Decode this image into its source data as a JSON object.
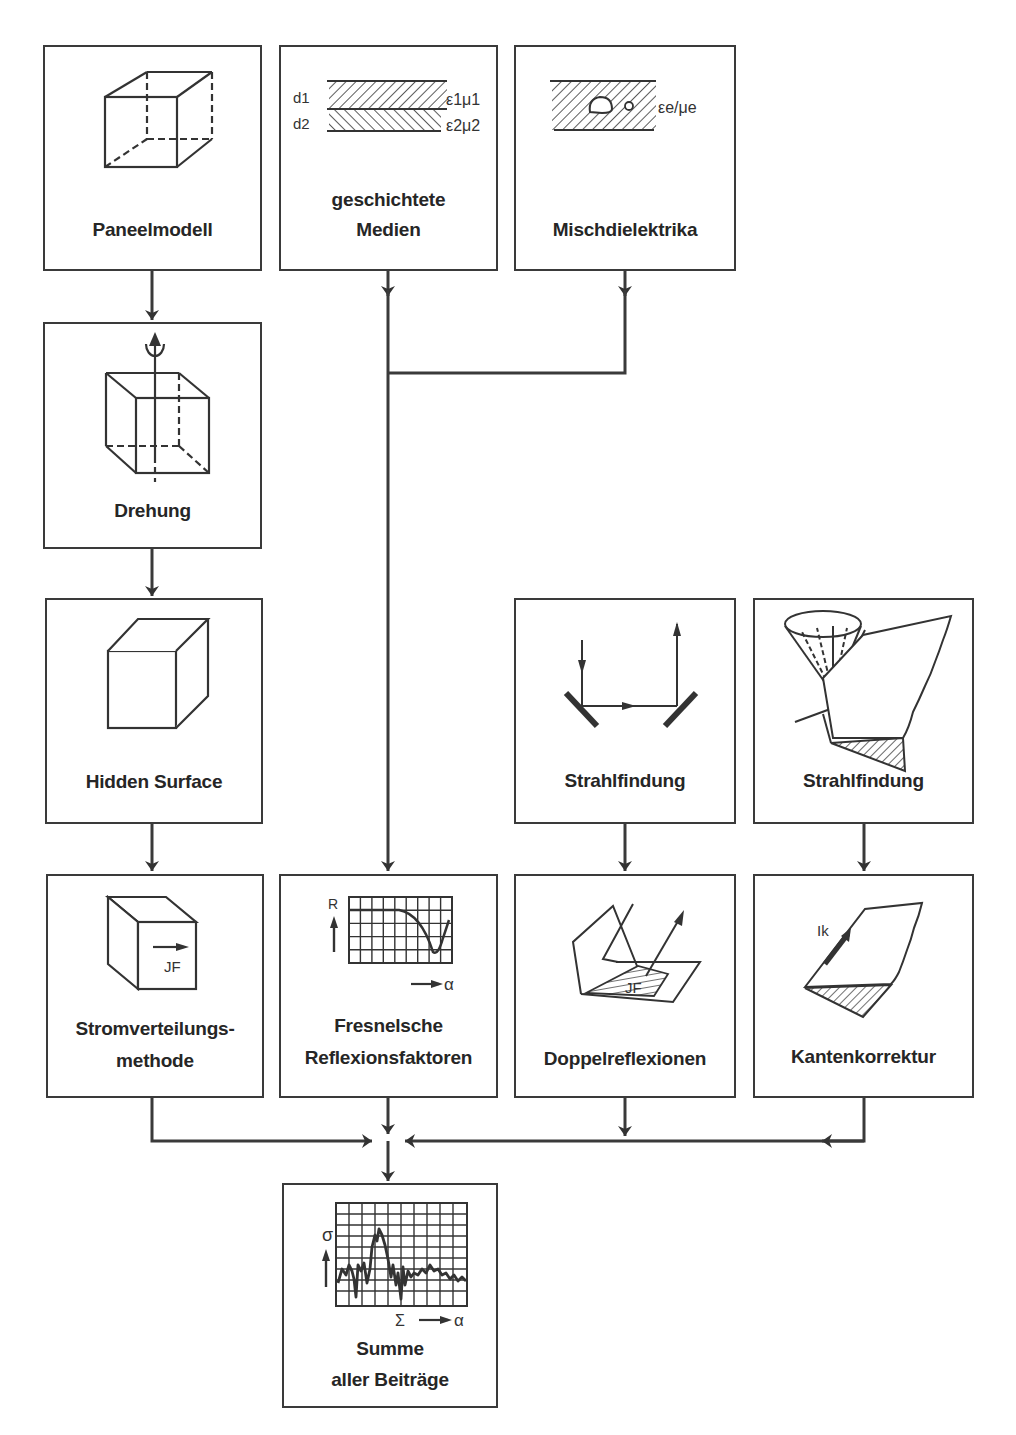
{
  "boxes": {
    "paneelmodell": {
      "label_lines": [
        "Paneelmodell"
      ]
    },
    "geschichtete_medien": {
      "label_lines": [
        "geschichtete",
        "Medien"
      ],
      "layer1": {
        "thickness": "d1",
        "params": "ε1μ1"
      },
      "layer2": {
        "thickness": "d2",
        "params": "ε2μ2"
      }
    },
    "mischdielektrika": {
      "label_lines": [
        "Mischdielektrika"
      ],
      "params": "εe/μe"
    },
    "drehung": {
      "label_lines": [
        "Drehung"
      ]
    },
    "hidden_surface": {
      "label_lines": [
        "Hidden Surface"
      ]
    },
    "strahlfindung_1": {
      "label_lines": [
        "Strahlfindung"
      ]
    },
    "strahlfindung_2": {
      "label_lines": [
        "Strahlfindung"
      ]
    },
    "stromverteilung": {
      "label_lines": [
        "Stromverteilungs-",
        "methode"
      ],
      "vector_label": "JF"
    },
    "fresnel": {
      "label_lines": [
        "Fresnelsche",
        "Reflexionsfaktoren"
      ],
      "y_axis": "R",
      "x_axis": "α"
    },
    "doppelreflexionen": {
      "label_lines": [
        "Doppelreflexionen"
      ],
      "vector_label": "JF"
    },
    "kantenkorrektur": {
      "label_lines": [
        "Kantenkorrektur"
      ],
      "vector_label": "Ik"
    },
    "summe": {
      "label_lines": [
        "Summe",
        "aller Beiträge"
      ],
      "y_axis": "σ",
      "sum_symbol": "Σ",
      "x_axis": "α"
    }
  },
  "flow": [
    {
      "from": "paneelmodell",
      "to": "drehung"
    },
    {
      "from": "drehung",
      "to": "hidden_surface"
    },
    {
      "from": "hidden_surface",
      "to": "stromverteilung"
    },
    {
      "from": "geschichtete_medien",
      "to": "fresnel"
    },
    {
      "from": "mischdielektrika",
      "to": "fresnel"
    },
    {
      "from": "strahlfindung_1",
      "to": "doppelreflexionen"
    },
    {
      "from": "strahlfindung_2",
      "to": "kantenkorrektur"
    },
    {
      "from": "stromverteilung",
      "to": "summe"
    },
    {
      "from": "fresnel",
      "to": "summe"
    },
    {
      "from": "doppelreflexionen",
      "to": "summe"
    },
    {
      "from": "kantenkorrektur",
      "to": "summe"
    }
  ],
  "colors": {
    "line": "#3a3a3a",
    "text": "#262626",
    "background": "#ffffff"
  }
}
